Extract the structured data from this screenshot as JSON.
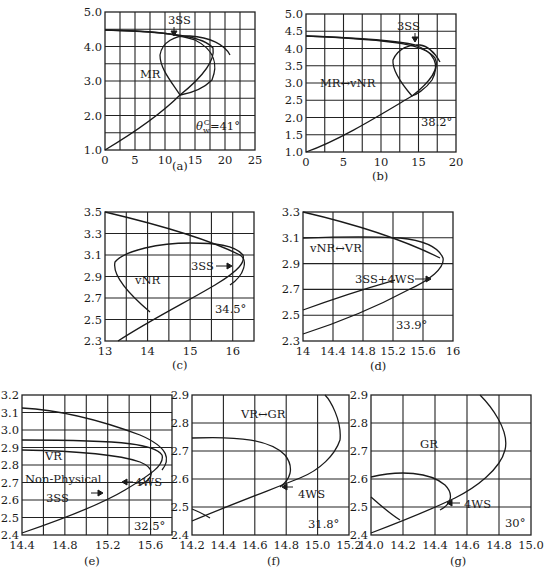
{
  "chart_data": [
    {
      "id": "a",
      "caption": "(a)",
      "type": "line",
      "xlim": [
        0,
        25
      ],
      "ylim": [
        1.0,
        5.0
      ],
      "xticks": [
        "0",
        "5",
        "10",
        "15",
        "20",
        "25"
      ],
      "yticks": [
        "1.0",
        "2.0",
        "3.0",
        "4.0",
        "5.0"
      ],
      "grid": true,
      "annotations": [
        "3SS",
        "MR",
        "θwC=41°"
      ],
      "curves": [
        {
          "name": "incident-polar-lower",
          "points": [
            [
              0,
              1.0
            ],
            [
              5,
              1.35
            ],
            [
              10,
              1.85
            ],
            [
              14.5,
              2.45
            ],
            [
              18,
              3.0
            ],
            [
              20,
              3.7
            ],
            [
              19.5,
              4.1
            ],
            [
              15,
              4.4
            ],
            [
              10,
              4.47
            ],
            [
              0,
              4.5
            ]
          ]
        },
        {
          "name": "reflected-polar",
          "points": [
            [
              0,
              4.5
            ],
            [
              8,
              4.45
            ],
            [
              12,
              4.35
            ],
            [
              15,
              4.15
            ],
            [
              18,
              3.7
            ],
            [
              19,
              3.4
            ],
            [
              18,
              2.85
            ],
            [
              14.5,
              2.45
            ],
            [
              11,
              3.2
            ],
            [
              9.8,
              3.8
            ],
            [
              10.5,
              4.2
            ],
            [
              13,
              4.4
            ],
            [
              17,
              4.35
            ],
            [
              20,
              4.0
            ]
          ]
        }
      ]
    },
    {
      "id": "b",
      "caption": "(b)",
      "type": "line",
      "xlim": [
        0,
        20
      ],
      "ylim": [
        1.0,
        5.0
      ],
      "xticks": [
        "0",
        "5",
        "10",
        "15",
        "20"
      ],
      "yticks": [
        "1.0",
        "1.5",
        "2.0",
        "2.5",
        "3.0",
        "3.5",
        "4.0",
        "4.5",
        "5.0"
      ],
      "grid": true,
      "annotations": [
        "3SS",
        "MR↔vNR",
        "38.2°"
      ],
      "curves": []
    },
    {
      "id": "c",
      "caption": "(c)",
      "type": "line",
      "xlim": [
        13,
        16.5
      ],
      "ylim": [
        2.3,
        3.5
      ],
      "xticks": [
        "13",
        "14",
        "15",
        "16"
      ],
      "yticks": [
        "2.3",
        "2.5",
        "2.7",
        "2.9",
        "3.1",
        "3.3",
        "3.5"
      ],
      "grid": true,
      "annotations": [
        "3SS",
        "vNR",
        "34.5°"
      ],
      "curves": []
    },
    {
      "id": "d",
      "caption": "(d)",
      "type": "line",
      "xlim": [
        14,
        16
      ],
      "ylim": [
        2.3,
        3.3
      ],
      "xticks": [
        "14",
        "14.4",
        "14.8",
        "15.2",
        "15.6",
        "16"
      ],
      "yticks": [
        "2.3",
        "2.5",
        "2.7",
        "2.9",
        "3.1",
        "3.3"
      ],
      "grid": true,
      "annotations": [
        "vNR↔VR",
        "3SS+4WS",
        "33.9°"
      ],
      "curves": []
    },
    {
      "id": "e",
      "caption": "(e)",
      "type": "line",
      "xlim": [
        14.4,
        15.8
      ],
      "ylim": [
        2.4,
        3.2
      ],
      "xticks": [
        "14.4",
        "14.8",
        "15.2",
        "15.6"
      ],
      "yticks": [
        "2.4",
        "2.5",
        "2.6",
        "2.7",
        "2.8",
        "2.9",
        "3.0",
        "3.1",
        "3.2"
      ],
      "grid": true,
      "annotations": [
        "VR",
        "Non-Physical",
        "3SS",
        "4WS",
        "32.5°"
      ],
      "curves": []
    },
    {
      "id": "f",
      "caption": "(f)",
      "type": "line",
      "xlim": [
        14.2,
        15.2
      ],
      "ylim": [
        2.4,
        2.9
      ],
      "xticks": [
        "14.2",
        "14.4",
        "14.6",
        "14.8",
        "15.0",
        "15.2"
      ],
      "yticks": [
        "2.4",
        "2.5",
        "2.6",
        "2.7",
        "2.8",
        "2.9"
      ],
      "grid": true,
      "annotations": [
        "VR↔GR",
        "4WS",
        "31.8°"
      ],
      "curves": []
    },
    {
      "id": "g",
      "caption": "(g)",
      "type": "line",
      "xlim": [
        14.0,
        15.0
      ],
      "ylim": [
        2.4,
        2.9
      ],
      "xticks": [
        "14.0",
        "14.2",
        "14.4",
        "14.6",
        "14.8",
        "15.0"
      ],
      "yticks": [
        "2.4",
        "2.5",
        "2.6",
        "2.7",
        "2.8",
        "2.9"
      ],
      "grid": true,
      "annotations": [
        "GR",
        "4WS",
        "30°"
      ],
      "curves": []
    }
  ],
  "labels": {
    "a": {
      "caption": "(a)",
      "l3ss": "3SS",
      "region": "MR",
      "angle": "=41°"
    },
    "b": {
      "caption": "(b)",
      "l3ss": "3SS",
      "region": "MR↔vNR",
      "angle": "38.2°"
    },
    "c": {
      "caption": "(c)",
      "l3ss": "3SS",
      "region": "vNR",
      "angle": "34.5°"
    },
    "d": {
      "caption": "(d)",
      "region": "vNR↔VR",
      "point": "3SS+4WS",
      "angle": "33.9°"
    },
    "e": {
      "caption": "(e)",
      "region": "VR",
      "np": "Non-Physical",
      "l3ss": "3SS",
      "l4ws": "4WS",
      "angle": "32.5°"
    },
    "f": {
      "caption": "(f)",
      "region": "VR↔GR",
      "l4ws": "4WS",
      "angle": "31.8°"
    },
    "g": {
      "caption": "(g)",
      "region": "GR",
      "l4ws": "4WS",
      "angle": "30°"
    }
  }
}
